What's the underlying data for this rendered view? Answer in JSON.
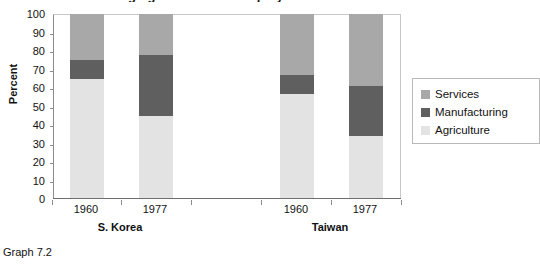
{
  "caption": "Graph 7.2",
  "chart_data": {
    "type": "bar",
    "subtype": "stacked-column-100",
    "title": "Changing Structure of Employment",
    "title_clipped": true,
    "xlabel": "",
    "ylabel": "Percent",
    "ylim": [
      0,
      100
    ],
    "ytick_step": 10,
    "ytick_labels": [
      "100",
      "90",
      "80",
      "70",
      "60",
      "50",
      "40",
      "30",
      "20",
      "10",
      "0"
    ],
    "grid": false,
    "legend_position": "right",
    "categories": [
      "1960",
      "1977",
      "1960",
      "1977"
    ],
    "groups": [
      {
        "name": "S. Korea",
        "years": [
          "1960",
          "1977"
        ]
      },
      {
        "name": "Taiwan",
        "years": [
          "1960",
          "1977"
        ]
      }
    ],
    "series": [
      {
        "name": "Agriculture",
        "color": "#e3e3e3",
        "values": [
          65,
          45,
          57,
          34
        ]
      },
      {
        "name": "Manufacturing",
        "color": "#5f5f5f",
        "values": [
          10,
          33,
          10,
          27
        ]
      },
      {
        "name": "Services",
        "color": "#a8a8a8",
        "values": [
          25,
          22,
          33,
          39
        ]
      }
    ],
    "bars": [
      {
        "group": "S. Korea",
        "year": "1960",
        "agriculture": 65,
        "manufacturing": 10,
        "services": 25
      },
      {
        "group": "S. Korea",
        "year": "1977",
        "agriculture": 45,
        "manufacturing": 33,
        "services": 22
      },
      {
        "group": "Taiwan",
        "year": "1960",
        "agriculture": 57,
        "manufacturing": 10,
        "services": 33
      },
      {
        "group": "Taiwan",
        "year": "1977",
        "agriculture": 34,
        "manufacturing": 27,
        "services": 39
      }
    ],
    "legend": [
      {
        "label": "Services",
        "color": "#a8a8a8"
      },
      {
        "label": "Manufacturing",
        "color": "#5f5f5f"
      },
      {
        "label": "Agriculture",
        "color": "#e3e3e3"
      }
    ]
  }
}
